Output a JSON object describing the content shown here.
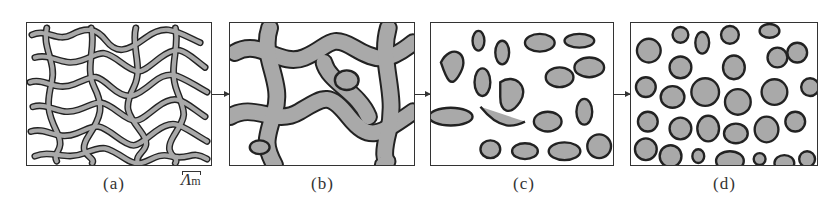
{
  "figure": {
    "panels": [
      {
        "id": "a",
        "caption": "(a)",
        "stage": "fine interconnected network"
      },
      {
        "id": "b",
        "caption": "(b)",
        "stage": "coarsened interconnected network"
      },
      {
        "id": "c",
        "caption": "(c)",
        "stage": "elongated isolated domains"
      },
      {
        "id": "d",
        "caption": "(d)",
        "stage": "rounded discrete particles"
      }
    ],
    "scale_marker": {
      "symbol": "Λ",
      "subscript": "m"
    },
    "colors": {
      "phase": "#a9a9a9",
      "outline": "#222222",
      "matrix": "#ffffff"
    }
  }
}
